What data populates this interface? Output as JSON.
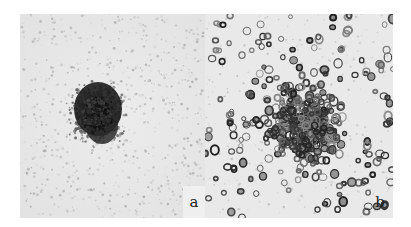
{
  "figure": {
    "panels": [
      {
        "id": "a",
        "label": "a",
        "description": "dense dark cluster of cells centered in field"
      },
      {
        "id": "b",
        "label": "b",
        "description": "dispersed ring-shaped cells across field"
      }
    ]
  }
}
